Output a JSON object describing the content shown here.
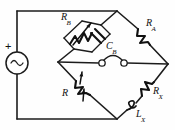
{
  "figure": {
    "name": "ac-bridge-circuit",
    "type": "schematic-diagram",
    "stroke_color": "#1c1c1c",
    "background_color": "#ffffff",
    "width": 175,
    "height": 130
  },
  "source": {
    "name": "ac-voltage-source",
    "symbol": "sine-wave",
    "polarity_label": "+"
  },
  "detector": {
    "name": "headphone-detector",
    "symbol": "two-terminal-arc",
    "label": ""
  },
  "components": {
    "rb": {
      "label_main": "R",
      "label_sub": "B",
      "type": "variable-resistor",
      "arm": "upper-left"
    },
    "cb": {
      "label_main": "C",
      "label_sub": "B",
      "type": "capacitor",
      "arm": "upper-left-parallel"
    },
    "ra": {
      "label_main": "R",
      "label_sub": "A",
      "type": "resistor",
      "arm": "upper-right"
    },
    "r": {
      "label_main": "R",
      "label_sub": "",
      "type": "variable-resistor",
      "arm": "lower-left"
    },
    "rx": {
      "label_main": "R",
      "label_sub": "X",
      "type": "resistor",
      "arm": "lower-right"
    },
    "lx": {
      "label_main": "L",
      "label_sub": "X",
      "type": "inductor",
      "arm": "lower-right-series"
    }
  }
}
